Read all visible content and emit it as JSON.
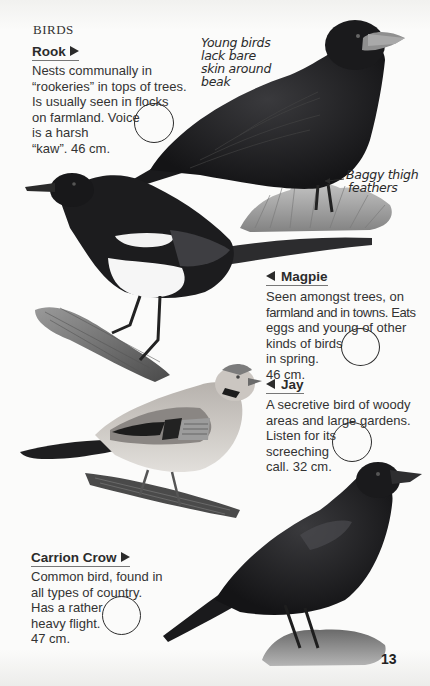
{
  "page": {
    "section_label": "BIRDS",
    "page_number": "13"
  },
  "birds": [
    {
      "name": "Rook",
      "arrow": "right",
      "description_lines": [
        "Nests communally in",
        "“rookeries” in tops of trees.",
        "Is usually seen in flocks",
        "on farmland. Voice",
        "is a harsh",
        "“kaw”. 46 cm."
      ],
      "annotations": [
        {
          "lines": [
            "Young birds",
            "lack bare",
            "skin around",
            "beak"
          ]
        },
        {
          "lines": [
            "Baggy thigh",
            "feathers"
          ]
        }
      ]
    },
    {
      "name": "Magpie",
      "arrow": "left",
      "description_lines": [
        "Seen amongst trees, on",
        "farmland and in towns. Eats",
        "eggs and young of other",
        "kinds of birds",
        "in spring.",
        "46 cm."
      ]
    },
    {
      "name": "Jay",
      "arrow": "left",
      "description_lines": [
        "A secretive bird of woody",
        "areas and large gardens.",
        "Listen for its",
        "screeching",
        "call. 32 cm."
      ]
    },
    {
      "name": "Carrion Crow",
      "arrow": "right",
      "description_lines": [
        "Common bird, found in",
        "all types of country.",
        "Has a rather",
        "heavy flight.",
        "47 cm."
      ]
    }
  ],
  "colors": {
    "ink": "#2b2b2b",
    "paper": "#fbfbfa",
    "plumage_black": "#1c1c1e",
    "jay_buff": "#c9c4bf"
  }
}
